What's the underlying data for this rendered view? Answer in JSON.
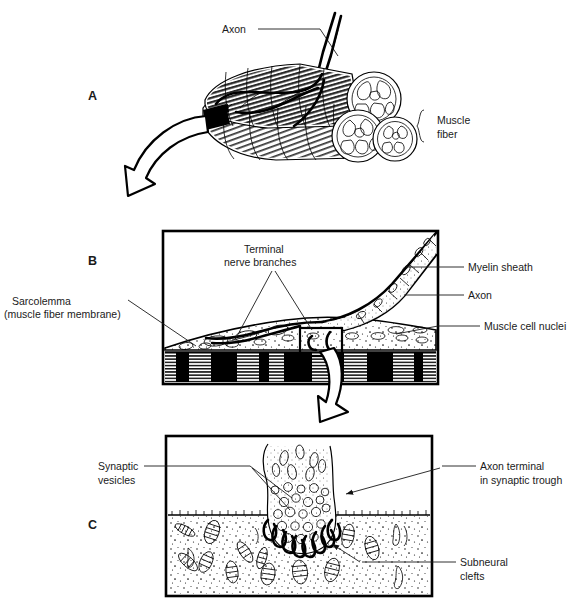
{
  "figure": {
    "background_color": "#ffffff",
    "ink_color": "#000000",
    "text_color": "#1a1a1a"
  },
  "panels": [
    {
      "id": "A",
      "letter": "A",
      "caption": "Muscle fiber bundle with innervating axon",
      "labels": [
        {
          "key": "axon",
          "text": "Axon"
        },
        {
          "key": "muscle_fiber",
          "text": "Muscle\nfiber",
          "line1": "Muscle",
          "line2": "fiber",
          "has_brace": true
        }
      ]
    },
    {
      "id": "B",
      "letter": "B",
      "caption": "Motor end plate region, longitudinal section",
      "labels": [
        {
          "key": "terminal_nerve_branches",
          "text": "Terminal\nnerve branches",
          "line1": "Terminal",
          "line2": "nerve branches"
        },
        {
          "key": "sarcolemma",
          "text": "Sarcolemma\n(muscle fiber membrane)",
          "line1": "Sarcolemma",
          "line2": "(muscle fiber membrane)"
        },
        {
          "key": "myelin_sheath",
          "text": "Myelin sheath"
        },
        {
          "key": "axon",
          "text": "Axon"
        },
        {
          "key": "muscle_cell_nuclei",
          "text": "Muscle cell nuclei"
        }
      ]
    },
    {
      "id": "C",
      "letter": "C",
      "caption": "Synaptic trough with vesicles and subneural clefts",
      "labels": [
        {
          "key": "synaptic_vesicles",
          "text": "Synaptic\nvesicles",
          "line1": "Synaptic",
          "line2": "vesicles"
        },
        {
          "key": "axon_terminal",
          "text": "Axon terminal\nin synaptic trough",
          "line1": "Axon terminal",
          "line2": "in synaptic trough"
        },
        {
          "key": "subneural_clefts",
          "text": "Subneural\nclefts",
          "line1": "Subneural",
          "line2": "clefts"
        }
      ]
    }
  ],
  "arrows": [
    {
      "key": "a-to-b",
      "from_panel": "A",
      "to_panel": "B",
      "direction": "down-left",
      "style": "hollow-curved"
    },
    {
      "key": "b-to-c",
      "from_panel": "B",
      "to_panel": "C",
      "direction": "down",
      "style": "hollow-curved"
    }
  ]
}
